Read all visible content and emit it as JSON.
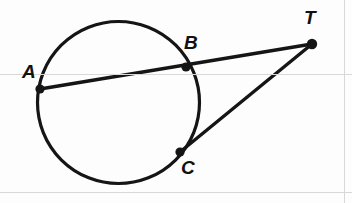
{
  "figure": {
    "canvas": {
      "width": 352,
      "height": 203
    },
    "stroke_color": "#151515",
    "background_color": "#fdfdfd",
    "artifact_color": "#d8d8d8"
  },
  "circle": {
    "name": "circle",
    "cx": 118.5,
    "cy": 102.5,
    "r": 81,
    "stroke_width": 3.2
  },
  "points": [
    {
      "id": "A",
      "label": "A",
      "x": 40,
      "y": 89,
      "label_x": 22,
      "label_y": 62,
      "dot_r": 4.6
    },
    {
      "id": "B",
      "label": "B",
      "x": 186,
      "y": 67,
      "label_x": 184,
      "label_y": 33,
      "dot_r": 4.6
    },
    {
      "id": "C",
      "label": "C",
      "x": 180,
      "y": 152,
      "label_x": 181,
      "label_y": 158,
      "dot_r": 4.6
    },
    {
      "id": "T",
      "label": "T",
      "x": 312,
      "y": 44,
      "label_x": 304,
      "label_y": 8,
      "dot_r": 5.2
    }
  ],
  "segments": [
    {
      "id": "AT",
      "name": "secant-line-a-t",
      "x1": 40,
      "y1": 89,
      "x2": 312,
      "y2": 44,
      "stroke_width": 3.4
    },
    {
      "id": "CT",
      "name": "tangent-line-c-t",
      "x1": 180,
      "y1": 152,
      "x2": 312,
      "y2": 44,
      "stroke_width": 3.4
    }
  ],
  "artifacts": [
    {
      "id": "scan-h-upper",
      "orientation": "horizontal",
      "pos": 74
    },
    {
      "id": "scan-h-lower",
      "orientation": "horizontal",
      "pos": 192
    },
    {
      "id": "scan-v-right",
      "orientation": "vertical",
      "pos": 344
    }
  ],
  "chart_data": {
    "type": "diagram",
    "shapes": [
      {
        "kind": "circle",
        "center": [
          118.5,
          102.5
        ],
        "radius": 81
      },
      {
        "kind": "segment",
        "from": "A",
        "to": "T",
        "through": "B",
        "role": "secant"
      },
      {
        "kind": "segment",
        "from": "C",
        "to": "T",
        "role": "tangent"
      }
    ],
    "labeled_points": [
      "A",
      "B",
      "C",
      "T"
    ],
    "on_circle": [
      "A",
      "B",
      "C"
    ],
    "external": [
      "T"
    ]
  }
}
